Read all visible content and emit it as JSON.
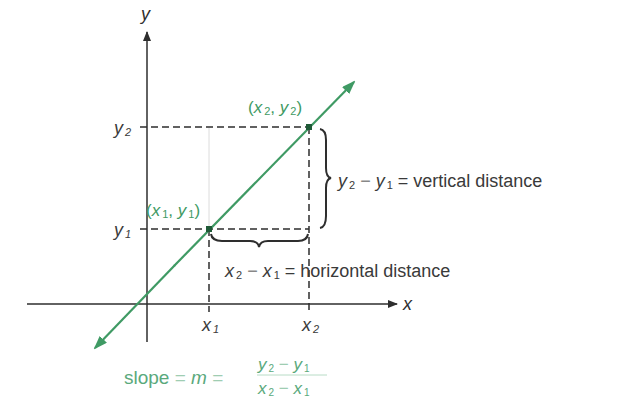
{
  "diagram": {
    "colors": {
      "line": "#3f9a64",
      "axis": "#2e2e2e",
      "dashed": "#2e2e2e",
      "text": "#3a3a3a",
      "formula": "#5aa97c",
      "point": "#1f5a37"
    },
    "axes": {
      "x_label": "x",
      "y_label": "y"
    },
    "ticks": {
      "x1": {
        "base": "x",
        "sub": "1"
      },
      "x2": {
        "base": "x",
        "sub": "2"
      },
      "y1": {
        "base": "y",
        "sub": "1"
      },
      "y2": {
        "base": "y",
        "sub": "2"
      }
    },
    "points": {
      "p1": {
        "label_open": "(",
        "x": "x",
        "xsub": "1",
        "sep": ", ",
        "y": "y",
        "ysub": "1",
        "label_close": ")"
      },
      "p2": {
        "label_open": "(",
        "x": "x",
        "xsub": "2",
        "sep": ", ",
        "y": "y",
        "ysub": "2",
        "label_close": ")"
      }
    },
    "annotations": {
      "vertical": {
        "a": "y",
        "a_sub": "2",
        "minus": " − ",
        "b": "y",
        "b_sub": "1",
        "equals": " = ",
        "text": "vertical distance"
      },
      "horizontal": {
        "a": "x",
        "a_sub": "2",
        "minus": " − ",
        "b": "x",
        "b_sub": "1",
        "equals": " = ",
        "text": "horizontal distance"
      }
    },
    "formula": {
      "word": "slope",
      "eq1": " = ",
      "m": "m",
      "eq2": " = ",
      "num": {
        "a": "y",
        "a_sub": "2",
        "minus": " − ",
        "b": "y",
        "b_sub": "1"
      },
      "den": {
        "a": "x",
        "a_sub": "2",
        "minus": " − ",
        "b": "x",
        "b_sub": "1"
      }
    }
  }
}
